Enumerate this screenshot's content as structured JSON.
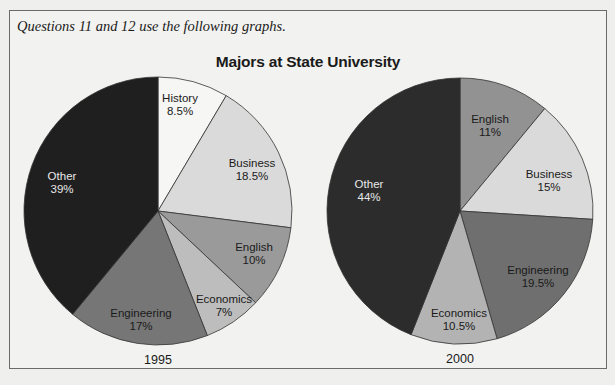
{
  "intro_text": "Questions 11 and 12 use the following graphs.",
  "chart_title": "Majors at State University",
  "chart_data": [
    {
      "type": "pie",
      "title": "Majors at State University",
      "label": "1995",
      "center": [
        158,
        211
      ],
      "radius": 134,
      "start_angle_deg": 0,
      "direction": "clockwise",
      "slices": [
        {
          "name": "History",
          "value": 8.5,
          "label": "8.5%",
          "color": "#f6f6f4",
          "text_color": "#1a1a1a",
          "label_pos": [
            180,
            102
          ]
        },
        {
          "name": "Business",
          "value": 18.5,
          "label": "18.5%",
          "color": "#dadada",
          "text_color": "#1a1a1a",
          "label_pos": [
            252,
            167
          ]
        },
        {
          "name": "English",
          "value": 10,
          "label": "10%",
          "color": "#9a9a9a",
          "text_color": "#1a1a1a",
          "label_pos": [
            254,
            251
          ]
        },
        {
          "name": "Economics",
          "value": 7,
          "label": "7%",
          "color": "#bdbdbd",
          "text_color": "#1a1a1a",
          "label_pos": [
            224,
            303
          ]
        },
        {
          "name": "Engineering",
          "value": 17,
          "label": "17%",
          "color": "#767676",
          "text_color": "#1a1a1a",
          "label_pos": [
            141,
            317
          ]
        },
        {
          "name": "Other",
          "value": 39,
          "label": "39%",
          "color": "#1f1f1f",
          "text_color": "#e8e8e8",
          "label_pos": [
            62,
            180
          ]
        }
      ]
    },
    {
      "type": "pie",
      "title": "Majors at State University",
      "label": "2000",
      "center": [
        460,
        211
      ],
      "radius": 133,
      "start_angle_deg": 0,
      "direction": "clockwise",
      "slices": [
        {
          "name": "English",
          "value": 11,
          "label": "11%",
          "color": "#929292",
          "text_color": "#1a1a1a",
          "label_pos": [
            490,
            123
          ]
        },
        {
          "name": "Business",
          "value": 15,
          "label": "15%",
          "color": "#dadada",
          "text_color": "#1a1a1a",
          "label_pos": [
            549,
            178
          ]
        },
        {
          "name": "Engineering",
          "value": 19.5,
          "label": "19.5%",
          "color": "#6f6f6f",
          "text_color": "#1a1a1a",
          "label_pos": [
            538,
            274
          ]
        },
        {
          "name": "Economics",
          "value": 10.5,
          "label": "10.5%",
          "color": "#b3b3b3",
          "text_color": "#1a1a1a",
          "label_pos": [
            459,
            317
          ]
        },
        {
          "name": "Other",
          "value": 44,
          "label": "44%",
          "color": "#2c2c2c",
          "text_color": "#e8e8e8",
          "label_pos": [
            369,
            188
          ]
        }
      ]
    }
  ],
  "colors": {
    "page_background": "#efefed",
    "frame_border": "#6a6a6a",
    "slice_edge": "#333333"
  }
}
